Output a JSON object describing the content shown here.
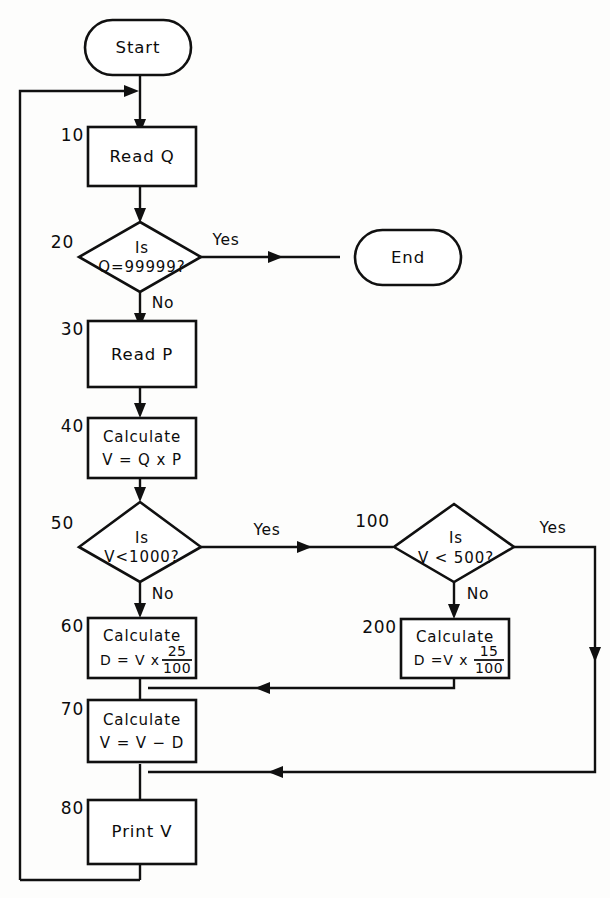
{
  "diagram": {
    "type": "flowchart",
    "caption": "",
    "colors": {
      "background": "#fdfdfc",
      "stroke": "#101010",
      "fill": "#ffffff",
      "text": "#0c0c0c"
    },
    "nodes": [
      {
        "id": "start",
        "shape": "terminal",
        "step": "",
        "label": "Start"
      },
      {
        "id": "read_q",
        "shape": "process",
        "step": "10",
        "label": "Read Q"
      },
      {
        "id": "is_q_99999",
        "shape": "decision",
        "step": "20",
        "line1": "Is",
        "line2": "Q=99999?"
      },
      {
        "id": "end",
        "shape": "terminal",
        "step": "",
        "label": "End"
      },
      {
        "id": "read_p",
        "shape": "process",
        "step": "30",
        "label": "Read P"
      },
      {
        "id": "calc_v",
        "shape": "process",
        "step": "40",
        "line1": "Calculate",
        "line2": "V = Q x P"
      },
      {
        "id": "is_v_1000",
        "shape": "decision",
        "step": "50",
        "line1": "Is",
        "line2": "V<1000?"
      },
      {
        "id": "is_v_500",
        "shape": "decision",
        "step": "100",
        "line1": "Is",
        "line2": "V < 500?"
      },
      {
        "id": "calc_d_25",
        "shape": "process",
        "step": "60",
        "line1": "Calculate",
        "line2": "D = V x",
        "numerator": "25",
        "denominator": "100"
      },
      {
        "id": "calc_d_15",
        "shape": "process",
        "step": "200",
        "line1": "Calculate",
        "line2": "D =V x",
        "numerator": "15",
        "denominator": "100"
      },
      {
        "id": "calc_v_minus_d",
        "shape": "process",
        "step": "70",
        "line1": "Calculate",
        "line2": "V = V − D"
      },
      {
        "id": "print_v",
        "shape": "process",
        "step": "80",
        "label": "Print V"
      }
    ],
    "edge_labels": {
      "yes_from_20": "Yes",
      "no_from_20": "No",
      "yes_from_50": "Yes",
      "no_from_50": "No",
      "yes_from_100": "Yes",
      "no_from_100": "No"
    }
  }
}
